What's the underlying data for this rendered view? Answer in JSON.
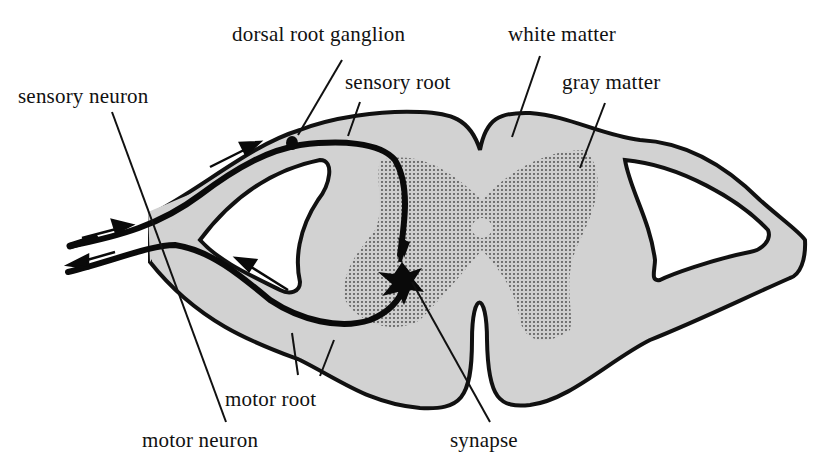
{
  "diagram": {
    "colors": {
      "cord_fill": "#d2d2d2",
      "gray_matter_dots": "#6a6a6a",
      "outline": "#111111",
      "background": "#ffffff"
    },
    "labels": {
      "dorsal_root_ganglion": "dorsal root ganglion",
      "white_matter": "white matter",
      "sensory_root": "sensory root",
      "gray_matter": "gray matter",
      "sensory_neuron": "sensory neuron",
      "motor_root": "motor root",
      "motor_neuron": "motor neuron",
      "synapse": "synapse"
    }
  }
}
